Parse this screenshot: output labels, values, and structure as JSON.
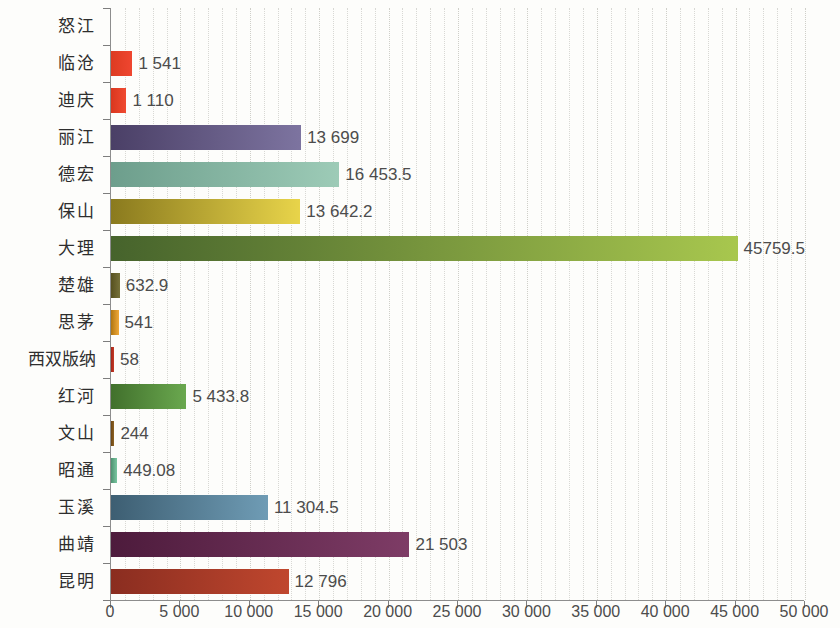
{
  "chart_data": {
    "type": "bar",
    "orientation": "horizontal",
    "title": "",
    "subtitle": "",
    "xlabel": "",
    "ylabel": "",
    "xlim": [
      0,
      50000
    ],
    "xtick_step": 5000,
    "minor_gridline_step": 1000,
    "grid": true,
    "grid_style": "dotted-vertical",
    "legend": "none",
    "categories": [
      "怒江",
      "临沧",
      "迪庆",
      "丽江",
      "德宏",
      "保山",
      "大理",
      "楚雄",
      "思茅",
      "西双版纳",
      "红河",
      "文山",
      "昭通",
      "玉溪",
      "曲靖",
      "昆明"
    ],
    "values": [
      null,
      1541,
      1110,
      13699,
      16453.5,
      13642.2,
      45759.5,
      632.9,
      541,
      58,
      5433.8,
      244,
      449.08,
      11304.5,
      21503,
      12796
    ],
    "value_labels": [
      "",
      "1 541",
      "1 110",
      "13 699",
      "16 453.5",
      "13 642.2",
      "45759.5",
      "632.9",
      "541",
      "58",
      "5 433.8",
      "244",
      "449.08",
      "11 304.5",
      "21 503",
      "12 796"
    ],
    "bar_colors_start": [
      "#cccccc",
      "#dd3b22",
      "#d9371f",
      "#4a3f66",
      "#6d9e8c",
      "#8a7a1e",
      "#46632c",
      "#56501f",
      "#b07510",
      "#a32418",
      "#41702c",
      "#6b4512",
      "#4e9170",
      "#3d5e72",
      "#4d1b3c",
      "#8a2d20"
    ],
    "bar_colors_end": [
      "#dddddd",
      "#ef4630",
      "#f04a31",
      "#7d74a0",
      "#9dcbb7",
      "#e8d44a",
      "#a8c74e",
      "#76713a",
      "#f0a93a",
      "#c43a26",
      "#6aa84f",
      "#8d6223",
      "#79c6a0",
      "#6f9cb5",
      "#7e3c66",
      "#c0472e"
    ],
    "xtick_labels": [
      "0",
      "5 000",
      "10 000",
      "15 000",
      "20 000",
      "25 000",
      "30 000",
      "35 000",
      "40 000",
      "45 000",
      "50 000"
    ],
    "xtick_values": [
      0,
      5000,
      10000,
      15000,
      20000,
      25000,
      30000,
      35000,
      40000,
      45000,
      50000
    ],
    "axis_color": "#8d8d8d",
    "text_color": "#4c4c4c",
    "label_color": "#2e2e2e",
    "background": "#fdfdfb"
  }
}
